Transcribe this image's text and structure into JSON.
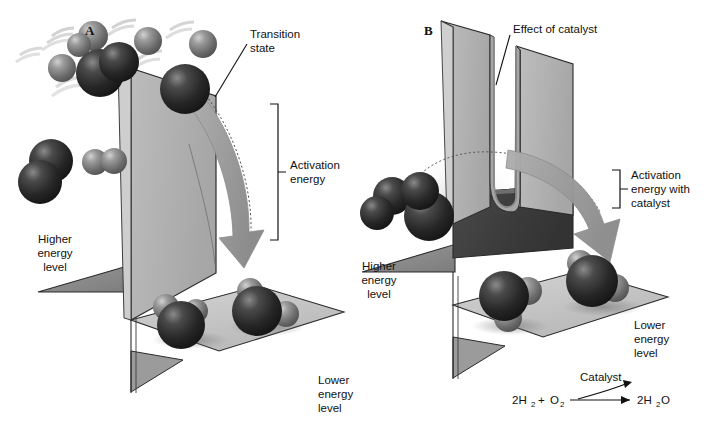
{
  "figure": {
    "background_color": "#ffffff"
  },
  "panels": [
    {
      "id": "A",
      "letter": "A",
      "description": "Uncatalyzed reaction: high energy barrier",
      "labels": {
        "transition_state": "Transition\nstate",
        "transition_state_line1": "Transition",
        "transition_state_line2": "state",
        "activation_energy_line1": "Activation",
        "activation_energy_line2": "energy",
        "higher_energy_line1": "Higher",
        "higher_energy_line2": "energy",
        "higher_energy_line3": "level",
        "lower_energy_line1": "Lower",
        "lower_energy_line2": "energy",
        "lower_energy_line3": "level"
      }
    },
    {
      "id": "B",
      "letter": "B",
      "description": "Catalyzed reaction: barrier notched by catalyst",
      "labels": {
        "effect_of_catalyst": "Effect of catalyst",
        "activation_catalyst_line1": "Activation",
        "activation_catalyst_line2": "energy with",
        "activation_catalyst_line3": "catalyst",
        "higher_energy_line1": "Higher",
        "higher_energy_line2": "energy",
        "higher_energy_line3": "level",
        "lower_energy_line1": "Lower",
        "lower_energy_line2": "energy",
        "lower_energy_line3": "level"
      },
      "equation": {
        "reactant_1_main": "2H",
        "reactant_1_sub": "2",
        "plus": "+",
        "reactant_2_main": "O",
        "reactant_2_sub": "2",
        "catalyst_label": "Catalyst",
        "product_main_1": "2H",
        "product_sub": "2",
        "product_main_2": "O"
      }
    }
  ],
  "colors": {
    "barrier_face": "#b5b5b5",
    "barrier_face_dark": "#3d3d3d",
    "platform_light": "#c9c9c9",
    "platform_dark": "#8f8f8f",
    "arrow_fill": "#9d9d9d",
    "oxygen_atom": "#2e2e2e",
    "hydrogen_atom": "#6e6e6e",
    "outline": "#2b2b2b",
    "text": "#111111"
  },
  "molecules": {
    "oxygen_label": "oxygen-atom",
    "hydrogen_label": "hydrogen-atom",
    "water_label": "water-molecule",
    "reactant_note": "H2 and O2 reactant molecules in motion",
    "product_note": "H2O product molecules at rest"
  }
}
